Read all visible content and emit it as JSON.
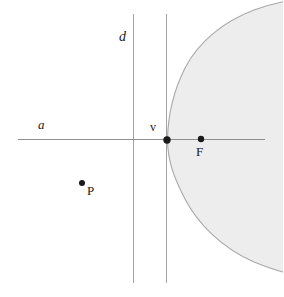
{
  "figure": {
    "type": "geometry-diagram",
    "width": 283,
    "height": 297,
    "background_color": "#ffffff"
  },
  "colors": {
    "line": "#9a9a9a",
    "axis": "#8f8f8f",
    "curve": "#a8a8a8",
    "shade_fill": "#ededed",
    "point": "#1a1a1a",
    "label": "#1a1a1a"
  },
  "labels": {
    "axis_label": "a",
    "directrix_label": "d",
    "vertex_label": "v",
    "focus_label": "F",
    "point_label": "P"
  },
  "geometry": {
    "axis_line": {
      "x1": 18,
      "y1": 139.5,
      "x2": 265,
      "y2": 139.5
    },
    "directrix_line": {
      "x": 133.5,
      "y1": 14,
      "y2": 283
    },
    "tangent_line": {
      "x": 166.5,
      "y1": 14,
      "y2": 283
    },
    "vertex_point": {
      "x": 167,
      "y": 140,
      "r": 3.6
    },
    "focus_point": {
      "x": 201,
      "y": 139,
      "r": 3.2
    },
    "free_point": {
      "x": 82,
      "y": 183,
      "r": 3.0
    },
    "parabola": {
      "vertex_x": 167,
      "vertex_y": 140,
      "opens": "right",
      "top_edge_at_right": 14,
      "bottom_edge_at_right": 262,
      "path": "M 167 140 C 168 112 178 74 200 48 C 220 25 250 12 283 6 L 283 268 C 248 262 218 250 198 230 C 177 208 168 170 167 140 Z"
    }
  }
}
